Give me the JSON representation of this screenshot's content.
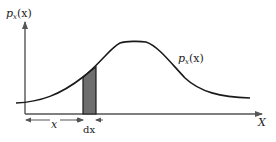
{
  "diagram": {
    "y_axis_label": {
      "main": "p",
      "sub": "x",
      "arg": "(x)"
    },
    "curve_label": {
      "main": "p",
      "sub": "x",
      "arg": "(x)"
    },
    "x_axis_label": "X",
    "interval_label": "x",
    "width_label": "dx",
    "colors": {
      "curve": "#1a1a1a",
      "axis": "#555555",
      "strip_fill": "#6e6e6e",
      "strip_stroke": "#1a1a1a"
    }
  }
}
